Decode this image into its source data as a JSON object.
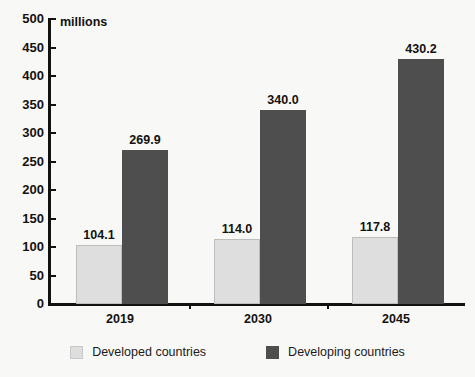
{
  "chart_data": {
    "type": "bar",
    "title": "",
    "subtitle": "",
    "unit_label": "millions",
    "xlabel": "",
    "ylabel": "",
    "ylim": [
      0,
      500
    ],
    "ytick_step": 50,
    "yticks": [
      "500",
      "450",
      "400",
      "350",
      "300",
      "250",
      "200",
      "150",
      "100",
      "50",
      "0"
    ],
    "grid": false,
    "legend_position": "bottom",
    "categories": [
      "2019",
      "2030",
      "2045"
    ],
    "series": [
      {
        "name": "Developed countries",
        "color": "#dedede",
        "values": [
          104.1,
          114.0,
          117.8
        ],
        "labels": [
          "104.1",
          "114.0",
          "117.8"
        ]
      },
      {
        "name": "Developing countries",
        "color": "#4e4e4e",
        "values": [
          269.9,
          340.0,
          430.2
        ],
        "labels": [
          "269.9",
          "340.0",
          "430.2"
        ]
      }
    ]
  },
  "legend": {
    "items": [
      {
        "label": "Developed countries",
        "swatch": "light"
      },
      {
        "label": "Developing countries",
        "swatch": "dark"
      }
    ]
  },
  "colors": {
    "background": "#f8f8f6",
    "axis": "#14120f",
    "text": "#14120f",
    "series_light": "#dedede",
    "series_dark": "#4e4e4e"
  }
}
